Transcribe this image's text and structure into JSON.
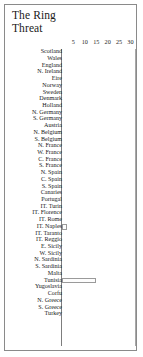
{
  "window": {
    "title_lines": [
      "The Ring",
      "Threat"
    ]
  },
  "chart_data": {
    "type": "bar",
    "orientation": "horizontal",
    "title": "The Ring Threat",
    "xlabel": "",
    "ylabel": "",
    "xlim": [
      0,
      32
    ],
    "xticks": [
      5,
      10,
      15,
      20,
      25,
      30
    ],
    "grid": false,
    "legend": null,
    "categories": [
      "Scotland",
      "Wales",
      "England",
      "N. Ireland",
      "Eire",
      "Norway",
      "Sweden",
      "Denmark",
      "Holland",
      "N. Germany",
      "S. Germany",
      "Austria",
      "N. Belgium",
      "S. Belgium",
      "N. France",
      "W. France",
      "C. France",
      "S. France",
      "N. Spain",
      "C. Spain",
      "S. Spain",
      "Canaries",
      "Portugal",
      "IT. Turin",
      "IT. Florence",
      "IT. Rome",
      "IT. Naples",
      "IT. Taranto",
      "IT. Reggio",
      "E. Sicily",
      "W. Sicily",
      "N. Sardinia",
      "S. Sardinia",
      "Malta",
      "Tunisia",
      "Yugoslavia",
      "Corfu",
      "N. Greece",
      "S. Greece",
      "Turkey"
    ],
    "values": [
      0,
      0,
      0,
      0,
      0,
      0,
      0,
      0,
      0,
      0,
      0,
      0,
      0,
      0,
      0,
      0,
      0,
      0,
      0,
      0,
      0,
      0,
      0,
      0,
      0,
      0,
      2,
      0,
      0,
      0,
      0,
      0,
      0,
      0,
      15,
      0,
      0,
      0,
      0,
      0
    ]
  }
}
